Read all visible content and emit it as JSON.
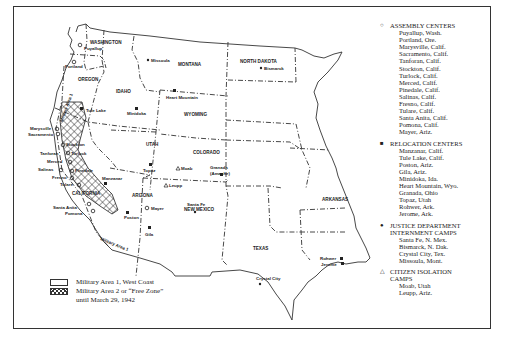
{
  "map": {
    "states": [
      "WASHINGTON",
      "OREGON",
      "CALIFORNIA",
      "IDAHO",
      "MONTANA",
      "WYOMING",
      "NORTH DAKOTA",
      "UTAH",
      "COLORADO",
      "ARIZONA",
      "NEW MEXICO",
      "TEXAS",
      "ARKANSAS"
    ],
    "zone_labels": {
      "military_area_1": "Military Area 1"
    },
    "cities": {
      "puyallup": "Puyallup",
      "portland": "Portland",
      "marysville": "Marysville",
      "sacramento": "Sacramento",
      "stockton": "Stockton",
      "tanforan": "Tanforan",
      "turlock": "Turlock",
      "merced": "Merced",
      "salinas": "Salinas",
      "pinedale": "Pinedale",
      "fresno": "Fresno",
      "tulare": "Tulare",
      "manzanar": "Manzanar",
      "santa_anita": "Santa Anita",
      "pomona": "Pomona",
      "tule_lake": "Tule Lake",
      "missoula": "Missoula",
      "heart_mountain": "Heart Mountain",
      "minidoka": "Minidoka",
      "bismarck": "Bismarck",
      "topaz": "Topaz",
      "moab": "Moab",
      "leupp": "Leupp",
      "granada_1": "Granada",
      "granada_2": "(Amache)",
      "santa_fe": "Santa Fe",
      "mayer": "Mayer",
      "poston": "Poston",
      "gila": "Gila",
      "rohwer": "Rohwer",
      "jerome": "Jerome",
      "crystal_city": "Crystal City"
    }
  },
  "legend": {
    "groups": [
      {
        "symbol": "○",
        "title": [
          "ASSEMBLY CENTERS"
        ],
        "items": [
          "Puyallup, Wash.",
          "Portland, Ore.",
          "Marysville, Calif.",
          "Sacramento, Calif.",
          "Tanforan, Calif.",
          "Stockton, Calif.",
          "Turlock, Calif.",
          "Merced, Calif.",
          "Pinedale, Calif.",
          "Salinas, Calif.",
          "Fresno, Calif.",
          "Tulare, Calif.",
          "Santa Anita, Calif.",
          "Pomona, Calif.",
          "Mayer, Ariz."
        ]
      },
      {
        "symbol": "■",
        "title": [
          "RELOCATION CENTERS"
        ],
        "items": [
          "Manzanar, Calif.",
          "Tule Lake, Calif.",
          "Poston, Ariz.",
          "Gila, Ariz.",
          "Minidoka, Ida.",
          "Heart Mountain, Wyo.",
          "Granada, Ohio",
          "Topaz, Utah",
          "Rohwer, Ark.",
          "Jerome, Ark."
        ]
      },
      {
        "symbol": "●",
        "title": [
          "JUSTICE DEPARTMENT",
          "INTERNMENT CAMPS"
        ],
        "items": [
          "Santa Fe, N. Mex.",
          "Bismarck, N. Dak.",
          "Crystal City, Tex.",
          "Missoula, Mont."
        ]
      },
      {
        "symbol": "△",
        "title": [
          "CITIZEN ISOLATION",
          "CAMPS"
        ],
        "items": [
          "Moab, Utah",
          "Leupp, Ariz."
        ]
      }
    ]
  },
  "area_legend": {
    "military_area_1": "Military Area 1, West Coast",
    "military_area_2": "Military Area 2 or “Free Zone”",
    "until": "until March 29, 1942"
  }
}
